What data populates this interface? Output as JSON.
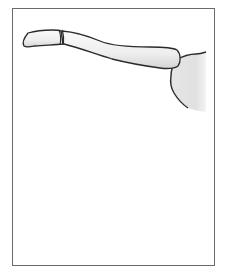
{
  "figure": {
    "alt": "Illustration of a fractured clavicle (collarbone) articulating with the acromion of the scapula",
    "colors": {
      "frame_border": "#6a6a6a",
      "bone_fill": "#f0f0f0",
      "bone_outline": "#2a2a2a",
      "scapula_fill": "#e2e2e2",
      "background": "#ffffff"
    }
  }
}
